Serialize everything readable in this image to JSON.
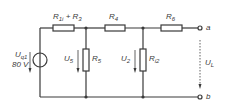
{
  "diagram": {
    "type": "circuit",
    "line_color": "#3a3a3a",
    "source": {
      "label_main": "U",
      "label_sub": "q1",
      "value": "80 V"
    },
    "resistors": [
      {
        "id": "r1i_r3",
        "main": "R",
        "sub": "1i",
        "plus": " + ",
        "main2": "R",
        "sub2": "3"
      },
      {
        "id": "r4",
        "main": "R",
        "sub": "4"
      },
      {
        "id": "r5",
        "main": "R",
        "sub": "5"
      },
      {
        "id": "ri2",
        "main": "R",
        "sub": "i2"
      },
      {
        "id": "r6",
        "main": "R",
        "sub": "6"
      }
    ],
    "voltages": [
      {
        "id": "u5",
        "main": "U",
        "sub": "5"
      },
      {
        "id": "u2",
        "main": "U",
        "sub": "2"
      },
      {
        "id": "ul",
        "main": "U",
        "sub": "L"
      }
    ],
    "terminals": [
      {
        "id": "a",
        "label": "a"
      },
      {
        "id": "b",
        "label": "b"
      }
    ]
  }
}
